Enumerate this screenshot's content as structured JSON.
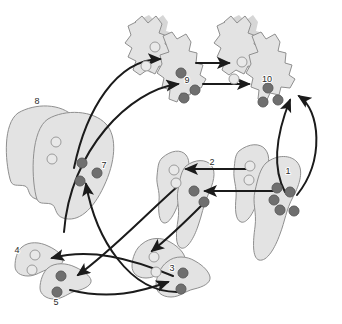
{
  "figure": {
    "background_color": "#ffffff",
    "outline_color": "#8d8d8d",
    "fill_color": "#e2e2e2",
    "shadow_color": "#d2d2d2",
    "arrow_color": "#1b1b1b",
    "marker_light_fill": "#e8e8e8",
    "marker_light_stroke": "#9a9a9a",
    "marker_dark_fill": "#6f6f6f",
    "marker_dark_stroke": "#5a5a5a",
    "label_color": "#2b2b2b"
  },
  "labels": [
    {
      "id": "1",
      "text": "1",
      "x": 288,
      "y": 174
    },
    {
      "id": "2",
      "text": "2",
      "x": 212,
      "y": 165
    },
    {
      "id": "3",
      "text": "3",
      "x": 172,
      "y": 271
    },
    {
      "id": "4",
      "text": "4",
      "x": 17,
      "y": 253
    },
    {
      "id": "5",
      "text": "5",
      "x": 56,
      "y": 305
    },
    {
      "id": "7",
      "text": "7",
      "x": 104,
      "y": 168
    },
    {
      "id": "8",
      "text": "8",
      "x": 37,
      "y": 104
    },
    {
      "id": "9",
      "text": "9",
      "x": 187,
      "y": 83
    },
    {
      "id": "10",
      "text": "10",
      "x": 265,
      "y": 82
    }
  ],
  "regions": [
    {
      "name": "region-9-upper-left-lobe",
      "label": null
    },
    {
      "name": "region-9-main-lobe",
      "label": "9"
    },
    {
      "name": "region-10-upper-left-lobe",
      "label": null
    },
    {
      "name": "region-10-main-lobe",
      "label": "10"
    },
    {
      "name": "region-8-outer-lobe",
      "label": "8"
    },
    {
      "name": "region-7-inner-lobe",
      "label": "7"
    },
    {
      "name": "region-2-left-lobe",
      "label": null
    },
    {
      "name": "region-2-right-lobe",
      "label": "2"
    },
    {
      "name": "region-1-left-lobe",
      "label": null
    },
    {
      "name": "region-1-main-lobe",
      "label": "1"
    },
    {
      "name": "region-4-lobe",
      "label": "4"
    },
    {
      "name": "region-5-lobe",
      "label": "5"
    },
    {
      "name": "region-3-left-lobe",
      "label": null
    },
    {
      "name": "region-3-main-lobe",
      "label": "3"
    }
  ],
  "markers": {
    "light": [
      {
        "x": 155,
        "y": 47
      },
      {
        "x": 146,
        "y": 66
      },
      {
        "x": 242,
        "y": 62
      },
      {
        "x": 234,
        "y": 79
      },
      {
        "x": 56,
        "y": 142
      },
      {
        "x": 52,
        "y": 159
      },
      {
        "x": 174,
        "y": 170
      },
      {
        "x": 176,
        "y": 183
      },
      {
        "x": 250,
        "y": 166
      },
      {
        "x": 249,
        "y": 180
      },
      {
        "x": 35,
        "y": 255
      },
      {
        "x": 32,
        "y": 270
      },
      {
        "x": 154,
        "y": 257
      },
      {
        "x": 156,
        "y": 272
      }
    ],
    "dark": [
      {
        "x": 181,
        "y": 73
      },
      {
        "x": 195,
        "y": 90
      },
      {
        "x": 184,
        "y": 98
      },
      {
        "x": 268,
        "y": 88
      },
      {
        "x": 263,
        "y": 102
      },
      {
        "x": 278,
        "y": 100
      },
      {
        "x": 82,
        "y": 163
      },
      {
        "x": 97,
        "y": 173
      },
      {
        "x": 80,
        "y": 181
      },
      {
        "x": 194,
        "y": 191
      },
      {
        "x": 204,
        "y": 202
      },
      {
        "x": 277,
        "y": 188
      },
      {
        "x": 274,
        "y": 200
      },
      {
        "x": 290,
        "y": 192
      },
      {
        "x": 280,
        "y": 210
      },
      {
        "x": 294,
        "y": 211
      },
      {
        "x": 61,
        "y": 276
      },
      {
        "x": 57,
        "y": 292
      },
      {
        "x": 183,
        "y": 273
      },
      {
        "x": 181,
        "y": 289
      }
    ]
  },
  "arrows": [
    {
      "name": "arrow-7-to-9-upper",
      "from": "7",
      "to": "9-upper"
    },
    {
      "name": "arrow-7-to-9",
      "from": "7",
      "to": "9"
    },
    {
      "name": "arrow-9-to-10-top",
      "from": "9",
      "to": "10-upper"
    },
    {
      "name": "arrow-9-to-10",
      "from": "9",
      "to": "10"
    },
    {
      "name": "arrow-1-to-10",
      "from": "1",
      "to": "10"
    },
    {
      "name": "arrow-1-to-10-alt",
      "from": "1",
      "to": "10-right"
    },
    {
      "name": "arrow-1-to-2-upper",
      "from": "1",
      "to": "2-upper"
    },
    {
      "name": "arrow-1-to-2-lower",
      "from": "1",
      "to": "2-lower"
    },
    {
      "name": "arrow-2-to-3",
      "from": "2",
      "to": "3-upper"
    },
    {
      "name": "arrow-2-to-5",
      "from": "2",
      "to": "5"
    },
    {
      "name": "arrow-3-to-4",
      "from": "3",
      "to": "4"
    },
    {
      "name": "arrow-3-to-7",
      "from": "3",
      "to": "7"
    },
    {
      "name": "arrow-5-to-3",
      "from": "5",
      "to": "3"
    }
  ]
}
